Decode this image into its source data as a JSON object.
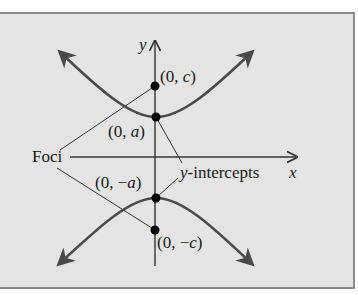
{
  "diagram": {
    "type": "hyperbola-vertical-transverse-axis",
    "axes": {
      "x_label": "x",
      "y_label": "y"
    },
    "points": [
      {
        "id": "focus-upper",
        "label": "(0, c)",
        "pre": "(0, ",
        "var": "c",
        "post": ")"
      },
      {
        "id": "vertex-upper",
        "label": "(0, a)",
        "pre": "(0, ",
        "var": "a",
        "post": ")"
      },
      {
        "id": "vertex-lower",
        "label": "(0, −a)",
        "pre": "(0, −",
        "var": "a",
        "post": ")"
      },
      {
        "id": "focus-lower",
        "label": "(0, −c)",
        "pre": "(0, −",
        "var": "c",
        "post": ")"
      }
    ],
    "annotations": {
      "foci": "Foci",
      "y_intercepts_var": "y",
      "y_intercepts_rest": "-intercepts"
    },
    "colors": {
      "background": "#e4e4e4",
      "curve": "#4a4a4a",
      "axis": "#333333",
      "point": "#000000",
      "border": "#8a8a8a"
    }
  }
}
